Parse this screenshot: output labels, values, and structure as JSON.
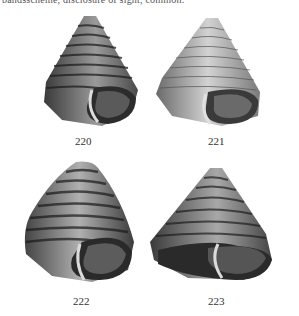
{
  "page": {
    "top_text_cropped": "bandsscheme, disclosure of sight, common."
  },
  "figures": [
    {
      "number": "220",
      "description": "conical shell with strong spiral ribs, aperture visible"
    },
    {
      "number": "221",
      "description": "conical shell with fine spiral lines, smoother surface"
    },
    {
      "number": "222",
      "description": "rounded conical shell with banded spiral striping"
    },
    {
      "number": "223",
      "description": "tall conical shell with spiral ridges, wide aperture"
    }
  ],
  "colors": {
    "ink": "#2a2a2a",
    "paper": "#ffffff",
    "mid": "#7a7a7a",
    "light": "#c8c8c8"
  }
}
